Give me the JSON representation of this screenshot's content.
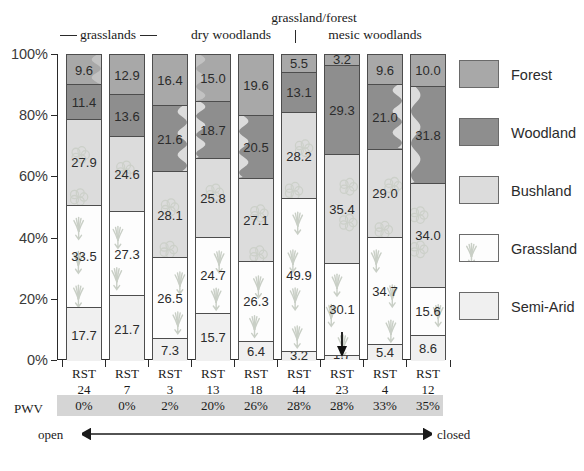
{
  "chart_data": {
    "type": "bar",
    "subtype": "stacked-bar-100-percent",
    "title": "",
    "xlabel": "",
    "ylabel": "",
    "ylim": [
      0,
      100
    ],
    "ytick_labels": [
      "0%",
      "20%",
      "40%",
      "60%",
      "80%",
      "100%"
    ],
    "ytick_values": [
      0,
      20,
      40,
      60,
      80,
      100
    ],
    "grid": false,
    "legend_position": "right",
    "categories": [
      "RST 24",
      "RST 7",
      "RST 3",
      "RST 13",
      "RST 18",
      "RST 44",
      "RST 23",
      "RST 4",
      "RST 12"
    ],
    "series": [
      {
        "name": "Forest",
        "values": [
          9.6,
          12.9,
          16.4,
          15.0,
          19.6,
          5.5,
          3.2,
          9.6,
          10.0
        ]
      },
      {
        "name": "Woodland",
        "values": [
          11.4,
          13.6,
          21.6,
          18.7,
          20.5,
          13.1,
          29.3,
          21.0,
          31.8
        ]
      },
      {
        "name": "Bushland",
        "values": [
          27.9,
          24.6,
          28.1,
          25.8,
          27.1,
          28.2,
          35.4,
          29.0,
          34.0
        ]
      },
      {
        "name": "Grassland",
        "values": [
          33.5,
          27.3,
          26.5,
          24.7,
          26.3,
          49.9,
          30.1,
          34.7,
          15.6
        ]
      },
      {
        "name": "Semi-Arid",
        "values": [
          17.7,
          21.7,
          7.3,
          15.7,
          6.4,
          3.2,
          1.7,
          5.4,
          8.6
        ]
      }
    ],
    "annotations": [
      {
        "type": "arrow",
        "target_bar": "RST 23",
        "target_series": "Semi-Arid",
        "label": "1.7"
      }
    ],
    "group_headers": [
      {
        "label": "grasslands",
        "bars": [
          "RST 24",
          "RST 7"
        ],
        "style": "rule"
      },
      {
        "label": "dry woodlands",
        "bars": [
          "RST 3",
          "RST 13",
          "RST 18"
        ],
        "style": "plain"
      },
      {
        "label": "grassland/forest",
        "bars": [
          "RST 44"
        ],
        "style": "tick"
      },
      {
        "label": "mesic woodlands",
        "bars": [
          "RST 23",
          "RST 4",
          "RST 12"
        ],
        "style": "plain"
      }
    ]
  },
  "axis": {
    "y_ticks": [
      {
        "label": "100%",
        "value": 100
      },
      {
        "label": "80%",
        "value": 80
      },
      {
        "label": "60%",
        "value": 60
      },
      {
        "label": "40%",
        "value": 40
      },
      {
        "label": "20%",
        "value": 20
      },
      {
        "label": "0%",
        "value": 0
      }
    ]
  },
  "groups": {
    "grasslands": "grasslands",
    "dry_woodlands": "dry woodlands",
    "grassland_forest": "grassland/forest",
    "mesic_woodlands": "mesic woodlands"
  },
  "bars": [
    {
      "id": "RST 24",
      "name_line1": "RST",
      "name_line2": "24",
      "pwv": "0%",
      "segments": [
        {
          "series": "Forest",
          "value": "9.6",
          "pct": 9.6
        },
        {
          "series": "Woodland",
          "value": "11.4",
          "pct": 11.4
        },
        {
          "series": "Bushland",
          "value": "27.9",
          "pct": 27.9
        },
        {
          "series": "Grassland",
          "value": "33.5",
          "pct": 33.5
        },
        {
          "series": "Semi-Arid",
          "value": "17.7",
          "pct": 17.7
        }
      ]
    },
    {
      "id": "RST 7",
      "name_line1": "RST",
      "name_line2": "7",
      "pwv": "0%",
      "segments": [
        {
          "series": "Forest",
          "value": "12.9",
          "pct": 12.9
        },
        {
          "series": "Woodland",
          "value": "13.6",
          "pct": 13.6
        },
        {
          "series": "Bushland",
          "value": "24.6",
          "pct": 24.6
        },
        {
          "series": "Grassland",
          "value": "27.3",
          "pct": 27.3
        },
        {
          "series": "Semi-Arid",
          "value": "21.7",
          "pct": 21.7
        }
      ]
    },
    {
      "id": "RST 3",
      "name_line1": "RST",
      "name_line2": "3",
      "pwv": "2%",
      "segments": [
        {
          "series": "Forest",
          "value": "16.4",
          "pct": 16.4
        },
        {
          "series": "Woodland",
          "value": "21.6",
          "pct": 21.6
        },
        {
          "series": "Bushland",
          "value": "28.1",
          "pct": 28.1
        },
        {
          "series": "Grassland",
          "value": "26.5",
          "pct": 26.5
        },
        {
          "series": "Semi-Arid",
          "value": "7.3",
          "pct": 7.3
        }
      ]
    },
    {
      "id": "RST 13",
      "name_line1": "RST",
      "name_line2": "13",
      "pwv": "20%",
      "segments": [
        {
          "series": "Forest",
          "value": "15.0",
          "pct": 15.0
        },
        {
          "series": "Woodland",
          "value": "18.7",
          "pct": 18.7
        },
        {
          "series": "Bushland",
          "value": "25.8",
          "pct": 25.8
        },
        {
          "series": "Grassland",
          "value": "24.7",
          "pct": 24.7
        },
        {
          "series": "Semi-Arid",
          "value": "15.7",
          "pct": 15.7
        }
      ]
    },
    {
      "id": "RST 18",
      "name_line1": "RST",
      "name_line2": "18",
      "pwv": "26%",
      "segments": [
        {
          "series": "Forest",
          "value": "19.6",
          "pct": 19.6
        },
        {
          "series": "Woodland",
          "value": "20.5",
          "pct": 20.5
        },
        {
          "series": "Bushland",
          "value": "27.1",
          "pct": 27.1
        },
        {
          "series": "Grassland",
          "value": "26.3",
          "pct": 26.3
        },
        {
          "series": "Semi-Arid",
          "value": "6.4",
          "pct": 6.4
        }
      ]
    },
    {
      "id": "RST 44",
      "name_line1": "RST",
      "name_line2": "44",
      "pwv": "28%",
      "segments": [
        {
          "series": "Forest",
          "value": "5.5",
          "pct": 5.5
        },
        {
          "series": "Woodland",
          "value": "13.1",
          "pct": 13.1
        },
        {
          "series": "Bushland",
          "value": "28.2",
          "pct": 28.2
        },
        {
          "series": "Grassland",
          "value": "49.9",
          "pct": 49.9
        },
        {
          "series": "Semi-Arid",
          "value": "3.2",
          "pct": 3.2
        }
      ]
    },
    {
      "id": "RST 23",
      "name_line1": "RST",
      "name_line2": "23",
      "pwv": "28%",
      "segments": [
        {
          "series": "Forest",
          "value": "3.2",
          "pct": 3.2
        },
        {
          "series": "Woodland",
          "value": "29.3",
          "pct": 29.3
        },
        {
          "series": "Bushland",
          "value": "35.4",
          "pct": 35.4
        },
        {
          "series": "Grassland",
          "value": "30.1",
          "pct": 30.1
        },
        {
          "series": "Semi-Arid",
          "value": "1.7",
          "pct": 1.7
        }
      ]
    },
    {
      "id": "RST 4",
      "name_line1": "RST",
      "name_line2": "4",
      "pwv": "33%",
      "segments": [
        {
          "series": "Forest",
          "value": "9.6",
          "pct": 9.6
        },
        {
          "series": "Woodland",
          "value": "21.0",
          "pct": 21.0
        },
        {
          "series": "Bushland",
          "value": "29.0",
          "pct": 29.0
        },
        {
          "series": "Grassland",
          "value": "34.7",
          "pct": 34.7
        },
        {
          "series": "Semi-Arid",
          "value": "5.4",
          "pct": 5.4
        }
      ]
    },
    {
      "id": "RST 12",
      "name_line1": "RST",
      "name_line2": "12",
      "pwv": "35%",
      "segments": [
        {
          "series": "Forest",
          "value": "10.0",
          "pct": 10.0
        },
        {
          "series": "Woodland",
          "value": "31.8",
          "pct": 31.8
        },
        {
          "series": "Bushland",
          "value": "34.0",
          "pct": 34.0
        },
        {
          "series": "Grassland",
          "value": "15.6",
          "pct": 15.6
        },
        {
          "series": "Semi-Arid",
          "value": "8.6",
          "pct": 8.6
        }
      ]
    }
  ],
  "pwv_row": {
    "key": "PWV",
    "values": [
      "0%",
      "0%",
      "2%",
      "20%",
      "26%",
      "28%",
      "28%",
      "33%",
      "35%"
    ]
  },
  "gradient": {
    "left_label": "open",
    "right_label": "closed"
  },
  "legend": {
    "items": [
      {
        "label": "Forest",
        "swatch": "forest-swatch-icon",
        "color": "#a8a8a8"
      },
      {
        "label": "Woodland",
        "swatch": "woodland-swatch-icon",
        "color": "#8e8e8e"
      },
      {
        "label": "Bushland",
        "swatch": "bushland-swatch-icon",
        "color": "#dcdcdc"
      },
      {
        "label": "Grassland",
        "swatch": "grassland-swatch-icon",
        "color": "#fdfdfd"
      },
      {
        "label": "Semi-Arid",
        "swatch": "semiarid-swatch-icon",
        "color": "#f0f0f0"
      }
    ]
  },
  "colors": {
    "forest": "#a8a8a8",
    "woodland": "#8e8e8e",
    "bushland": "#dcdcdc",
    "grassland": "#fdfdfd",
    "semi_arid": "#f0f0f0",
    "axis": "#2a2a2a",
    "pwv_band": "#d5d5d5"
  },
  "annotation_arrow": {
    "name": "semi-arid-value-arrow",
    "label": "1.7"
  }
}
